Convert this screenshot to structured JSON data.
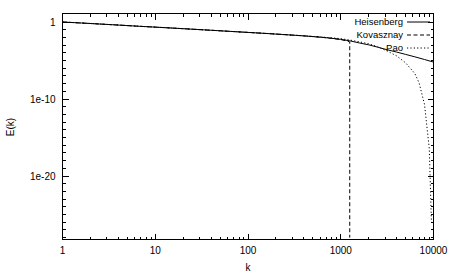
{
  "chart_data": {
    "type": "line",
    "title": "",
    "xlabel": "k",
    "ylabel": "E(k)",
    "xscale": "log",
    "yscale": "log",
    "xlim": [
      1,
      10000
    ],
    "ylim": [
      1e-28,
      1.3
    ],
    "grid": false,
    "legend_position": "top-right",
    "xticks": [
      {
        "value": 1,
        "label": "1"
      },
      {
        "value": 10,
        "label": "10"
      },
      {
        "value": 100,
        "label": "100"
      },
      {
        "value": 1000,
        "label": "1000"
      },
      {
        "value": 10000,
        "label": "10000"
      }
    ],
    "yticks": [
      {
        "value": 1,
        "label": "1"
      },
      {
        "value": 1e-10,
        "label": "1e-10"
      },
      {
        "value": 1e-20,
        "label": "1e-20"
      }
    ],
    "series": [
      {
        "name": "Heisenberg",
        "style": "solid",
        "color": "#000000",
        "x": [
          1,
          1.6,
          2.5,
          4,
          6.3,
          10,
          16,
          25,
          40,
          63,
          100,
          160,
          250,
          400,
          630,
          800,
          1000,
          1250,
          1600,
          2000,
          2500,
          3200,
          4000,
          5000,
          6300,
          8000,
          10000,
          12500
        ],
        "y": [
          1.0,
          0.74,
          0.55,
          0.4,
          0.29,
          0.215,
          0.158,
          0.116,
          0.0845,
          0.0615,
          0.0445,
          0.032,
          0.0228,
          0.0158,
          0.0102,
          0.0076,
          0.0055,
          0.0036,
          0.00185,
          0.00108,
          0.00054,
          0.00024,
          0.000125,
          6.2e-05,
          3e-05,
          1.35e-05,
          6.2e-06,
          3.2e-06
        ]
      },
      {
        "name": "Kovasznay",
        "style": "dashed",
        "color": "#000000",
        "x": [
          1,
          1.6,
          2.5,
          4,
          6.3,
          10,
          16,
          25,
          40,
          63,
          100,
          160,
          250,
          400,
          630,
          800,
          1000,
          1150,
          1250,
          1250
        ],
        "y": [
          1.0,
          0.74,
          0.55,
          0.4,
          0.29,
          0.215,
          0.158,
          0.116,
          0.0845,
          0.0615,
          0.0445,
          0.032,
          0.0228,
          0.0158,
          0.0102,
          0.0076,
          0.0052,
          0.0036,
          0.0026,
          1e-28
        ],
        "cutoff_k": 1250,
        "note": "drops vertically to zero at cutoff wavenumber"
      },
      {
        "name": "Pao",
        "style": "dotted",
        "color": "#000000",
        "x": [
          1,
          1.6,
          2.5,
          4,
          6.3,
          10,
          16,
          25,
          40,
          63,
          100,
          160,
          250,
          400,
          630,
          800,
          1000,
          1250,
          1600,
          2000,
          2500,
          3200,
          4000,
          5000,
          6300,
          7000,
          8000,
          9000,
          9500
        ],
        "y": [
          1.0,
          0.74,
          0.55,
          0.4,
          0.29,
          0.215,
          0.158,
          0.116,
          0.0845,
          0.0615,
          0.0445,
          0.032,
          0.0228,
          0.016,
          0.011,
          0.0088,
          0.0068,
          0.0046,
          0.0026,
          0.0015,
          0.0006,
          0.00016,
          4e-05,
          5e-06,
          2e-07,
          1.2e-08,
          2e-11,
          4e-17,
          1e-26
        ]
      }
    ]
  },
  "legend": {
    "entries": [
      {
        "label": "Heisenberg",
        "style": "solid"
      },
      {
        "label": "Kovasznay",
        "style": "dashed"
      },
      {
        "label": "Pao",
        "style": "dotted"
      }
    ]
  },
  "axes": {
    "x_title": "k",
    "y_title": "E(k)"
  }
}
